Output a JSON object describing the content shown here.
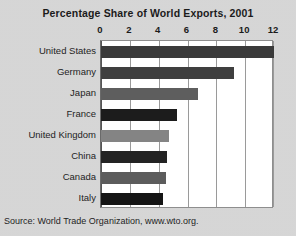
{
  "chart_data": {
    "type": "bar",
    "orientation": "horizontal",
    "title": "Percentage Share of World Exports, 2001",
    "xlabel": "",
    "ylabel": "",
    "xlim": [
      0,
      12
    ],
    "xticks": [
      0,
      2,
      4,
      6,
      8,
      10,
      12
    ],
    "xtick_labels": [
      "0",
      "2",
      "4",
      "6",
      "8",
      "10",
      "12"
    ],
    "grid": true,
    "legend": false,
    "categories": [
      "United States",
      "Germany",
      "Japan",
      "France",
      "United Kingdom",
      "China",
      "Canada",
      "Italy"
    ],
    "values": [
      12.0,
      9.2,
      6.7,
      5.3,
      4.7,
      4.6,
      4.5,
      4.3
    ],
    "bar_colors": [
      "#3a3a3a",
      "#3f3f3f",
      "#5e5e5e",
      "#1c1c1c",
      "#848484",
      "#232323",
      "#5c5c5c",
      "#151515"
    ]
  },
  "source": {
    "note": "Source: World Trade Organization, www.wto.org."
  },
  "colors": {
    "background": "#d1d1d1",
    "plot_background": "#ffffff",
    "gridline": "#9a9a9a",
    "text": "#1b1b1b"
  }
}
